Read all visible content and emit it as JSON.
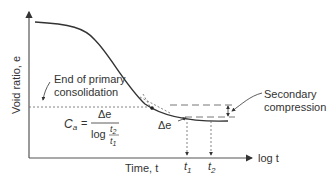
{
  "diagram": {
    "title": "",
    "y_axis_label": "Void ratio, e",
    "x_axis_label": "Time, t",
    "log_axis_label": "log t",
    "annotations": {
      "end_primary_line1": "End of primary",
      "end_primary_line2": "consolidation",
      "secondary_line1": "Secondary",
      "secondary_line2": "compression",
      "delta_e": "Δe",
      "t1": "t",
      "t1_sub": "1",
      "t2": "t",
      "t2_sub": "2"
    },
    "formula": {
      "lhs": "C",
      "lhs_sub": "a",
      "equals": "=",
      "numerator": "Δe",
      "denominator_log": "log",
      "frac_num": "t",
      "frac_num_sub": "2",
      "frac_den": "t",
      "frac_den_sub": "1"
    },
    "colors": {
      "line": "#333333",
      "axis": "#555555",
      "dashed": "#666666"
    }
  }
}
